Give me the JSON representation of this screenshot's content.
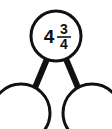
{
  "diagram": {
    "type": "number-bond",
    "background_color": "#ffffff",
    "stroke_color": "#111111",
    "top_node": {
      "label": "4 3/4",
      "whole": "4",
      "numerator": "3",
      "denominator": "4",
      "value": 4.75,
      "filled": true
    },
    "bottom_nodes": [
      {
        "label": "",
        "filled": false,
        "position": "left"
      },
      {
        "label": "",
        "filled": false,
        "position": "right"
      }
    ],
    "connectors": [
      {
        "from": "top_node",
        "to": "bottom-left-node"
      },
      {
        "from": "top_node",
        "to": "bottom-right-node"
      }
    ]
  }
}
